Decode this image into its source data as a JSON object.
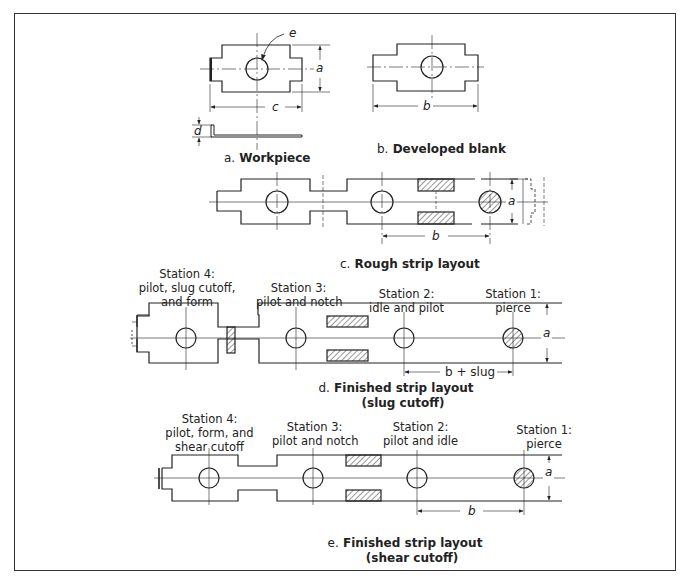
{
  "figure": {
    "a": {
      "letter": "a.",
      "caption": "Workpiece",
      "dims": {
        "a": "a",
        "c": "c",
        "d": "d",
        "e": "e"
      }
    },
    "b": {
      "letter": "b.",
      "caption": "Developed blank",
      "dims": {
        "b": "b"
      }
    },
    "c": {
      "letter": "c.",
      "caption": "Rough strip layout",
      "dims": {
        "a": "a",
        "b": "b"
      }
    },
    "d": {
      "letter": "d.",
      "caption_line1": "Finished strip layout",
      "caption_line2": "(slug cutoff)",
      "dims": {
        "a": "a",
        "pitch": "b + slug"
      },
      "stations": [
        {
          "title": "Station 4:",
          "desc": [
            "pilot, slug cutoff,",
            "and form"
          ]
        },
        {
          "title": "Station 3:",
          "desc": [
            "pilot and notch"
          ]
        },
        {
          "title": "Station 2:",
          "desc": [
            "idle and pilot"
          ]
        },
        {
          "title": "Station 1:",
          "desc": [
            "pierce"
          ]
        }
      ]
    },
    "e": {
      "letter": "e.",
      "caption_line1": "Finished strip layout",
      "caption_line2": "(shear cutoff)",
      "dims": {
        "a": "a",
        "pitch": "b"
      },
      "stations": [
        {
          "title": "Station 4:",
          "desc": [
            "pilot, form, and",
            "shear cutoff"
          ]
        },
        {
          "title": "Station 3:",
          "desc": [
            "pilot and notch"
          ]
        },
        {
          "title": "Station 2:",
          "desc": [
            "pilot and idle"
          ]
        },
        {
          "title": "Station 1:",
          "desc": [
            "pierce"
          ]
        }
      ]
    }
  }
}
